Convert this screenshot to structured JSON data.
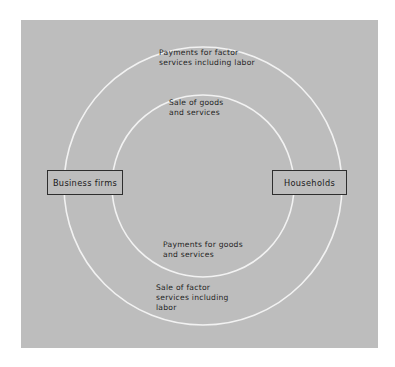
{
  "diagram": {
    "type": "circular-flow",
    "background_color": "#bdbdbd",
    "page_color": "#ffffff",
    "circle_stroke_color": "#f2f2f2",
    "box_border_color": "#2e2e2e",
    "text_color": "#1f1f1f",
    "entities": [
      {
        "id": "business-firms",
        "label": "Business firms",
        "position": "left"
      },
      {
        "id": "households",
        "label": "Households",
        "position": "right"
      }
    ],
    "flows": [
      {
        "id": "payments-factor-services",
        "label": "Payments for factor\nservices including labor",
        "ring": "outer",
        "position": "top"
      },
      {
        "id": "sale-goods-services",
        "label": "Sale of goods\nand services",
        "ring": "inner",
        "position": "top"
      },
      {
        "id": "payments-goods-services",
        "label": "Payments for goods\nand services",
        "ring": "inner",
        "position": "bottom"
      },
      {
        "id": "sale-factor-services",
        "label": "Sale of factor\nservices including\nlabor",
        "ring": "outer",
        "position": "bottom"
      }
    ],
    "rings": [
      {
        "id": "outer-circle",
        "center_x": 203,
        "center_y": 186,
        "radius": 139
      },
      {
        "id": "inner-circle",
        "center_x": 203,
        "center_y": 186,
        "radius": 91
      }
    ]
  }
}
